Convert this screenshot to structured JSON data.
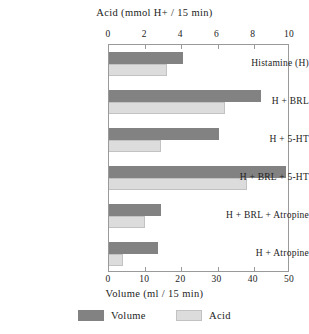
{
  "chart_data": {
    "type": "bar",
    "orientation": "horizontal",
    "title": "",
    "top_axis_label": "Acid (mmol H+ / 15 min)",
    "bottom_axis_label": "Volume (ml / 15 min)",
    "ylabel": "",
    "grid": false,
    "legend_position": "bottom",
    "categories": [
      "Histamine (H)",
      "H + BRL",
      "H + 5-HT",
      "H + BRL + 5-HT",
      "H + BRL + Atropine",
      "H + Atropine"
    ],
    "series": [
      {
        "name": "Volume",
        "axis": "bottom",
        "unit": "ml / 15 min",
        "color": "#828282",
        "xlim": [
          0,
          50
        ],
        "values": [
          20.5,
          42.0,
          30.5,
          49.0,
          14.5,
          13.5
        ]
      },
      {
        "name": "Acid",
        "axis": "top",
        "unit": "mmol H+ / 15 min",
        "color": "#dcdcdc",
        "xlim": [
          0,
          10
        ],
        "values": [
          3.2,
          6.4,
          2.9,
          7.6,
          2.0,
          0.8
        ]
      }
    ],
    "top_ticks": [
      0,
      2,
      4,
      6,
      8,
      10
    ],
    "bottom_ticks": [
      0,
      10,
      20,
      30,
      40,
      50
    ],
    "top_tick_labels": [
      "0",
      "2",
      "4",
      "6",
      "8",
      "10"
    ],
    "bottom_tick_labels": [
      "0",
      "10",
      "20",
      "30",
      "40",
      "50"
    ]
  },
  "legend": {
    "items": [
      {
        "label": "Volume",
        "color": "#828282"
      },
      {
        "label": "Acid",
        "color": "#dcdcdc"
      }
    ]
  }
}
